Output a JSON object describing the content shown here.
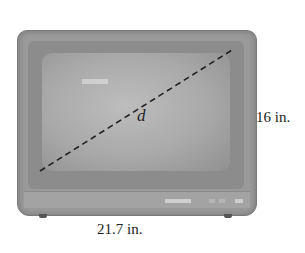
{
  "figure": {
    "diagonal_label": "d",
    "height_label": "16 in.",
    "width_label": "21.7 in."
  },
  "colors": {
    "tv_body": "#9a9a9a",
    "screen": "#b0b0b0",
    "dashed_line": "#222222",
    "text": "#222222"
  }
}
